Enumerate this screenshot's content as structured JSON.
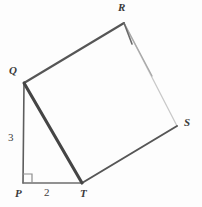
{
  "figure": {
    "kind": "geometry-diagram",
    "background_color": "#fdfdfd",
    "ink_color": "#4a4a4a",
    "hidden_edge_color": "#c9c9c9",
    "width": 202,
    "height": 207,
    "vertices": [
      {
        "id": "P",
        "label": "P",
        "x": 23,
        "y": 183,
        "label_x": 15,
        "label_y": 188
      },
      {
        "id": "Q",
        "label": "Q",
        "x": 24,
        "y": 83,
        "label_x": 9,
        "label_y": 65
      },
      {
        "id": "T",
        "label": "T",
        "x": 82,
        "y": 183,
        "label_x": 80,
        "label_y": 188
      },
      {
        "id": "R",
        "label": "R",
        "x": 124,
        "y": 23,
        "label_x": 118,
        "label_y": 2
      },
      {
        "id": "S",
        "label": "S",
        "x": 177,
        "y": 126,
        "label_x": 184,
        "label_y": 117
      }
    ],
    "edges": [
      {
        "id": "PQ",
        "from": "P",
        "to": "Q",
        "style": "solid",
        "weight": 1.5,
        "color": "#575757",
        "hidden": false
      },
      {
        "id": "PT",
        "from": "P",
        "to": "T",
        "style": "solid",
        "weight": 1.5,
        "color": "#6a6a6a",
        "hidden": false
      },
      {
        "id": "QT",
        "from": "Q",
        "to": "T",
        "style": "solid",
        "weight": 3.0,
        "color": "#444444",
        "hidden": false
      },
      {
        "id": "QR",
        "from": "Q",
        "to": "R",
        "style": "solid",
        "weight": 2.0,
        "color": "#555555",
        "hidden": false
      },
      {
        "id": "TS",
        "from": "T",
        "to": "S",
        "style": "solid",
        "weight": 2.0,
        "color": "#555555",
        "hidden": false
      },
      {
        "id": "RS",
        "from": "R",
        "to": "S",
        "style": "faint",
        "weight": 1.2,
        "color": "#c9c9c9",
        "hidden": true
      }
    ],
    "measurements": [
      {
        "id": "side-PQ",
        "value": "3",
        "edge": "PQ",
        "label_x": 8,
        "label_y": 132
      },
      {
        "id": "side-PT",
        "value": "2",
        "edge": "PT",
        "label_x": 44,
        "label_y": 187
      }
    ],
    "right_angle": {
      "id": "right-angle-P",
      "at_vertex": "P",
      "size": 8,
      "color": "#8a8a8a"
    }
  }
}
